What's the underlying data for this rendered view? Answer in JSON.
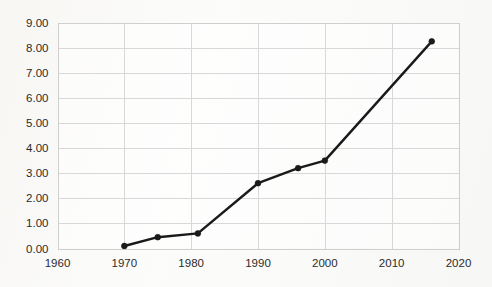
{
  "chart_data": {
    "type": "line",
    "title": "",
    "subtitle": "",
    "xlabel": "",
    "ylabel": "",
    "xlim": [
      1960,
      2020
    ],
    "ylim": [
      0,
      9
    ],
    "grid": true,
    "legend": false,
    "legend_position": "none",
    "x_tick_labels": [
      "1960",
      "1970",
      "1980",
      "1990",
      "2000",
      "2010",
      "2020"
    ],
    "x_ticks": [
      1960,
      1970,
      1980,
      1990,
      2000,
      2010,
      2020
    ],
    "y_tick_labels": [
      "0.00",
      "1.00",
      "2.00",
      "3.00",
      "4.00",
      "5.00",
      "6.00",
      "7.00",
      "8.00",
      "9.00"
    ],
    "y_ticks": [
      0,
      1,
      2,
      3,
      4,
      5,
      6,
      7,
      8,
      9
    ],
    "series": [
      {
        "name": "series-1",
        "color": "#1a1a1a",
        "marker": "circle",
        "x": [
          1970,
          1975,
          1981,
          1990,
          1996,
          2000,
          2016
        ],
        "values": [
          0.1,
          0.45,
          0.6,
          2.6,
          3.2,
          3.5,
          8.25
        ]
      }
    ],
    "points": [
      {
        "x": 1970,
        "y": 0.1
      },
      {
        "x": 1975,
        "y": 0.45
      },
      {
        "x": 1981,
        "y": 0.6
      },
      {
        "x": 1990,
        "y": 2.6
      },
      {
        "x": 1996,
        "y": 3.2
      },
      {
        "x": 2000,
        "y": 3.5
      },
      {
        "x": 2016,
        "y": 8.25
      }
    ],
    "colors": {
      "line": "#1a1a1a",
      "marker": "#1a1a1a",
      "grid": "#d8d8d8",
      "axis": "#cfcfcf",
      "background": "#fbfbfa",
      "text": "#2b2b2b"
    }
  }
}
